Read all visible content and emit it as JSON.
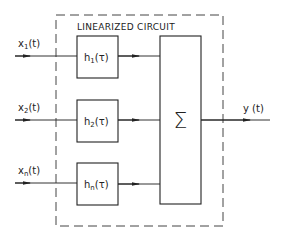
{
  "diagram": {
    "title": "LINEARIZED CIRCUIT",
    "inputs": [
      {
        "label": "x",
        "sub": "1",
        "arg": "(t)"
      },
      {
        "label": "x",
        "sub": "2",
        "arg": "(t)"
      },
      {
        "label": "x",
        "sub": "n",
        "arg": "(t)"
      }
    ],
    "filters": [
      {
        "label": "h",
        "sub": "1",
        "arg": "(τ)"
      },
      {
        "label": "h",
        "sub": "2",
        "arg": "(τ)"
      },
      {
        "label": "h",
        "sub": "n",
        "arg": "(τ)"
      }
    ],
    "summer": {
      "symbol": "Σ"
    },
    "output": {
      "label": "y (t)"
    }
  }
}
